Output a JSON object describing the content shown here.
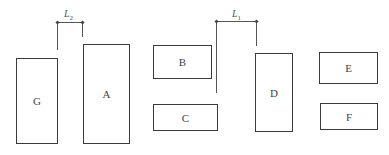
{
  "diagram": {
    "boxes": [
      {
        "id": "G",
        "label": "G"
      },
      {
        "id": "A",
        "label": "A"
      },
      {
        "id": "B",
        "label": "B"
      },
      {
        "id": "C",
        "label": "C"
      },
      {
        "id": "D",
        "label": "D"
      },
      {
        "id": "E",
        "label": "E"
      },
      {
        "id": "F",
        "label": "F"
      }
    ],
    "dimensions": [
      {
        "id": "L2",
        "symbol": "L",
        "subscript": "2",
        "between": [
          "G",
          "A"
        ]
      },
      {
        "id": "L1",
        "symbol": "L",
        "subscript": "1",
        "between": [
          "B/C",
          "D"
        ]
      }
    ],
    "colors": {
      "stroke": "#3a3a3a",
      "background": "#ffffff"
    }
  }
}
